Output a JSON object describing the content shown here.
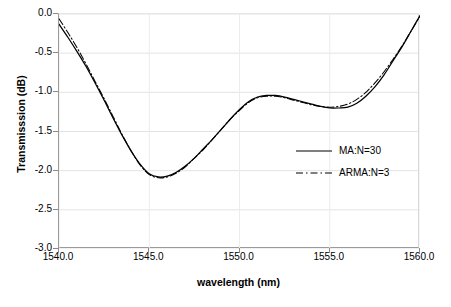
{
  "chart_data": {
    "type": "line",
    "title": "",
    "xlabel": "wavelength (nm)",
    "ylabel": "Transmisssion (dB)",
    "xlim": [
      1540,
      1560
    ],
    "ylim": [
      -3.0,
      0.0
    ],
    "grid": true,
    "legend_position": "inside-right",
    "xticks": [
      "1540.0",
      "1545.0",
      "1550.0",
      "1555.0",
      "1560.0"
    ],
    "xtick_values": [
      1540,
      1545,
      1550,
      1555,
      1560
    ],
    "yticks": [
      "0.0",
      "-0.5",
      "-1.0",
      "-1.5",
      "-2.0",
      "-2.5",
      "-3.0"
    ],
    "ytick_values": [
      0.0,
      -0.5,
      -1.0,
      -1.5,
      -2.0,
      -2.5,
      -3.0
    ],
    "x": [
      1540.0,
      1540.5,
      1541.0,
      1541.5,
      1542.0,
      1542.5,
      1543.0,
      1543.5,
      1544.0,
      1544.5,
      1545.0,
      1545.5,
      1546.0,
      1546.5,
      1547.0,
      1547.5,
      1548.0,
      1548.5,
      1549.0,
      1549.5,
      1550.0,
      1550.5,
      1551.0,
      1551.5,
      1552.0,
      1552.5,
      1553.0,
      1553.5,
      1554.0,
      1554.5,
      1555.0,
      1555.5,
      1556.0,
      1556.5,
      1557.0,
      1557.5,
      1558.0,
      1558.5,
      1559.0,
      1559.5,
      1560.0
    ],
    "series": [
      {
        "name": "MA:N=30",
        "style": "solid",
        "color": "#000000",
        "values": [
          -0.13,
          -0.3,
          -0.48,
          -0.67,
          -0.88,
          -1.1,
          -1.33,
          -1.55,
          -1.75,
          -1.92,
          -2.04,
          -2.08,
          -2.07,
          -2.02,
          -1.94,
          -1.84,
          -1.72,
          -1.6,
          -1.47,
          -1.34,
          -1.22,
          -1.12,
          -1.06,
          -1.04,
          -1.04,
          -1.06,
          -1.09,
          -1.12,
          -1.15,
          -1.18,
          -1.2,
          -1.2,
          -1.19,
          -1.14,
          -1.05,
          -0.93,
          -0.78,
          -0.6,
          -0.42,
          -0.22,
          -0.02
        ]
      },
      {
        "name": "ARMA:N=3",
        "style": "dash-dot",
        "color": "#000000",
        "values": [
          -0.06,
          -0.24,
          -0.43,
          -0.64,
          -0.86,
          -1.08,
          -1.31,
          -1.54,
          -1.75,
          -1.93,
          -2.05,
          -2.09,
          -2.08,
          -2.03,
          -1.95,
          -1.84,
          -1.73,
          -1.6,
          -1.47,
          -1.34,
          -1.23,
          -1.13,
          -1.07,
          -1.05,
          -1.05,
          -1.07,
          -1.1,
          -1.13,
          -1.16,
          -1.18,
          -1.19,
          -1.18,
          -1.15,
          -1.09,
          -1.0,
          -0.88,
          -0.74,
          -0.58,
          -0.41,
          -0.22,
          -0.03
        ]
      }
    ]
  },
  "legend": {
    "items": [
      {
        "label": "MA:N=30",
        "style": "solid"
      },
      {
        "label": "ARMA:N=3",
        "style": "dash-dot"
      }
    ]
  }
}
